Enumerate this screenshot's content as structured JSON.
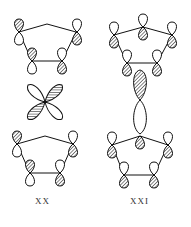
{
  "figure": {
    "structures": [
      {
        "id": "XX",
        "label": "XX",
        "description": "Two cyclopentadienyl rings with p-orbital lobes sandwiching a four-lobed d orbital (cloverleaf)"
      },
      {
        "id": "XXI",
        "label": "XXI",
        "description": "Two cyclopentadienyl rings with p-orbital lobes sandwiching an elongated dz2-like orbital (two lobes along axis)"
      }
    ],
    "colors": {
      "line": "#111111",
      "hatch": "#333333",
      "background": "#ffffff"
    }
  }
}
